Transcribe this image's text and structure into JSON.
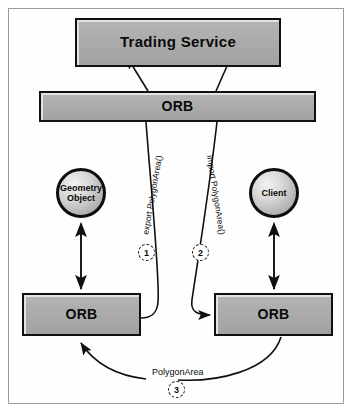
{
  "diagram": {
    "frame": {
      "border_color": "#9a9a9a"
    },
    "nodes": {
      "trading_service": {
        "label": "Trading Service",
        "shape": "box"
      },
      "orb_top": {
        "label": "ORB",
        "shape": "box"
      },
      "orb_left": {
        "label": "ORB",
        "shape": "box"
      },
      "orb_right": {
        "label": "ORB",
        "shape": "box"
      },
      "geometry_object": {
        "label_line1": "Geometry",
        "label_line2": "Object",
        "shape": "circle"
      },
      "client": {
        "label": "Client",
        "shape": "circle"
      }
    },
    "edge_labels": {
      "export": "export PolygonArea()",
      "import": "import PolygonArea()",
      "result": "PolygonArea"
    },
    "steps": [
      {
        "number": "1"
      },
      {
        "number": "2"
      },
      {
        "number": "3"
      }
    ],
    "colors": {
      "box_fill": "#aaaaaa",
      "box_border": "#111111",
      "box_highlight": "#e3e3e3",
      "line": "#101010",
      "frame": "#9a9a9a",
      "background": "#ffffff"
    }
  }
}
